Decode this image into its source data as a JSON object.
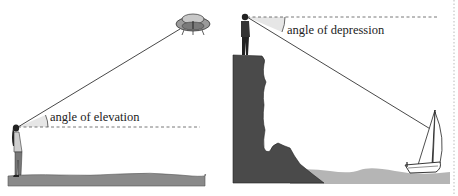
{
  "diagrams": [
    {
      "id": "elevation",
      "label": "angle of elevation",
      "observer": "person-standing-on-ground",
      "target": "flying-saucer"
    },
    {
      "id": "depression",
      "label": "angle of depression",
      "observer": "person-on-cliff",
      "target": "sailboat"
    }
  ],
  "colors": {
    "ground": "#8a8a8a",
    "cliff": "#4a4a4a",
    "water": "#b5b5b5",
    "angle_fill": "#e6e6e6",
    "line": "#333333"
  }
}
